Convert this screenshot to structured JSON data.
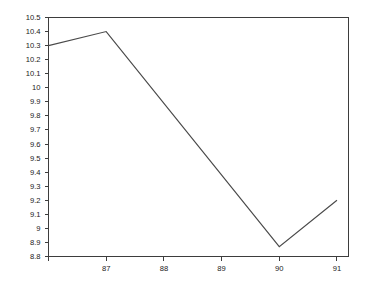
{
  "chart_data": {
    "type": "line",
    "title": "",
    "subtitle": "",
    "xlabel": "",
    "ylabel": "",
    "x": [
      86,
      87,
      90,
      91
    ],
    "values": [
      10.3,
      10.4,
      8.87,
      9.2
    ],
    "series": [
      {
        "name": "",
        "x": [
          86,
          87,
          90,
          91
        ],
        "values": [
          10.3,
          10.4,
          8.87,
          9.2
        ]
      }
    ],
    "xlim": [
      86,
      91.2
    ],
    "ylim": [
      8.8,
      10.5
    ],
    "x_ticks": [
      86,
      87,
      88,
      89,
      90,
      91
    ],
    "x_tick_labels": [
      "",
      "87",
      "88",
      "89",
      "90",
      "91"
    ],
    "y_ticks": [
      8.8,
      8.9,
      9.0,
      9.1,
      9.2,
      9.3,
      9.4,
      9.5,
      9.6,
      9.7,
      9.8,
      9.9,
      10.0,
      10.1,
      10.2,
      10.3,
      10.4,
      10.5
    ],
    "y_tick_labels": [
      "8.8",
      "8.9",
      "9",
      "9.1",
      "9.2",
      "9.3",
      "9.4",
      "9.5",
      "9.6",
      "9.7",
      "9.8",
      "9.9",
      "10",
      "10.1",
      "10.2",
      "10.3",
      "10.4",
      "10.5"
    ],
    "grid": false,
    "legend": false,
    "legend_position": "none",
    "colors": {
      "line": "#4a4a4a",
      "axis": "#3d3d3d",
      "background": "#ffffff",
      "text": "#1a1a1a"
    }
  }
}
